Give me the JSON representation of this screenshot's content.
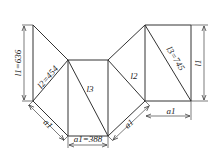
{
  "diagram": {
    "type": "sheet-metal development (unfolded pattern) with triangulation lines",
    "colors": {
      "line": "#333333",
      "background": "#ffffff"
    },
    "labels": {
      "l1_left": "l1=636",
      "l2_left": "l2=454",
      "l3_center": "l3",
      "a1_bottom": "a1=388",
      "a1_left": "a1",
      "l2_right": "l2",
      "l3_right": "l3=745",
      "l1_right": "l1",
      "a1_right_diag": "a1",
      "a1_right": "a1"
    },
    "values": {
      "l1": 636,
      "l2": 454,
      "l3": 745,
      "a1": 388
    }
  }
}
